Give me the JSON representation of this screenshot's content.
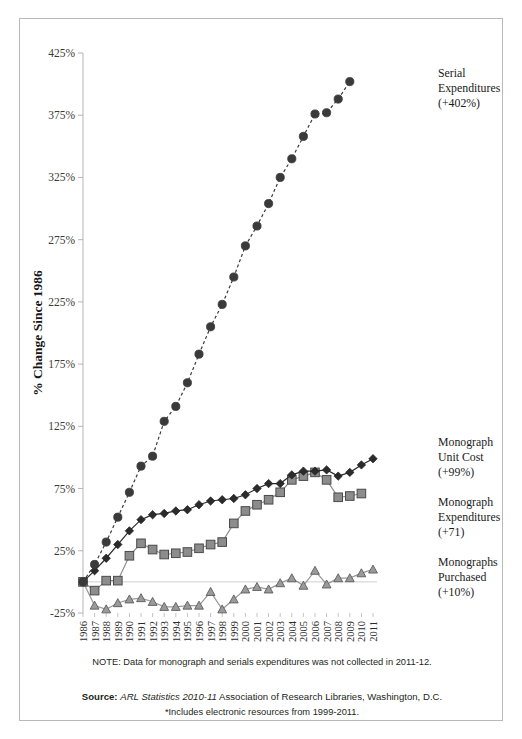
{
  "chart_data": {
    "type": "line",
    "title": "",
    "xlabel": "",
    "ylabel": "% Change Since 1986",
    "ylim": [
      -25,
      425
    ],
    "ytick_labels": [
      "425%",
      "375%",
      "325%",
      "275%",
      "225%",
      "175%",
      "125%",
      "75%",
      "25%",
      "-25%"
    ],
    "ytick_values": [
      425,
      375,
      325,
      275,
      225,
      175,
      125,
      75,
      25,
      -25
    ],
    "grid": false,
    "legend_position": "right-inline",
    "categories": [
      "1986",
      "1987",
      "1988",
      "1989",
      "1990",
      "1991",
      "1992",
      "1993",
      "1994",
      "1995",
      "1996",
      "1997",
      "1998",
      "1999",
      "2000",
      "2001",
      "2002",
      "2003",
      "2004",
      "2005",
      "2006",
      "2007",
      "2008",
      "2009",
      "2010",
      "2011"
    ],
    "series": [
      {
        "name": "Serial Expenditures",
        "marker": "circle",
        "line_style": "dashed",
        "color": "#3a3a3a",
        "change_label": "(+402%)",
        "values": [
          0,
          14,
          32,
          52,
          72,
          93,
          101,
          129,
          141,
          160,
          183,
          205,
          223,
          245,
          270,
          286,
          304,
          325,
          340,
          358,
          376,
          377,
          388,
          402,
          null,
          null
        ]
      },
      {
        "name": "Monograph Unit Cost",
        "marker": "diamond",
        "line_style": "solid",
        "color": "#2b2b2b",
        "change_label": "(+99%)",
        "values": [
          0,
          9,
          19,
          30,
          41,
          50,
          54,
          55,
          57,
          58,
          62,
          65,
          66,
          67,
          70,
          75,
          79,
          79,
          86,
          89,
          89,
          90,
          85,
          88,
          94,
          99
        ]
      },
      {
        "name": "Monograph Expenditures",
        "marker": "square",
        "line_style": "solid",
        "color": "#8c8c8c",
        "change_label": "(+71)",
        "values": [
          0,
          -7,
          1,
          1,
          21,
          31,
          26,
          22,
          23,
          24,
          27,
          30,
          32,
          47,
          57,
          62,
          66,
          72,
          82,
          85,
          88,
          82,
          68,
          69,
          71,
          null
        ]
      },
      {
        "name": "Monographs Purchased",
        "marker": "triangle",
        "line_style": "solid",
        "color": "#9a9a9a",
        "change_label": "(+10%)",
        "values": [
          0,
          -19,
          -22,
          -17,
          -14,
          -13,
          -16,
          -20,
          -20,
          -19,
          -19,
          -8,
          -22,
          -14,
          -6,
          -4,
          -6,
          -1,
          3,
          -3,
          9,
          -2,
          3,
          3,
          7,
          10
        ]
      }
    ],
    "annotations": [
      {
        "id": "serial-label",
        "lines": [
          "Serial",
          "Expenditures",
          "(+402%)"
        ]
      },
      {
        "id": "unit-cost-label",
        "lines": [
          "Monograph",
          "Unit Cost",
          "(+99%)"
        ]
      },
      {
        "id": "mono-exp-label",
        "lines": [
          "Monograph",
          "Expenditures",
          "(+71)"
        ]
      },
      {
        "id": "mono-pur-label",
        "lines": [
          "Monographs",
          "Purchased",
          "(+10%)"
        ]
      }
    ]
  },
  "footnotes": {
    "note": "NOTE: Data for monograph and serials expenditures was not collected in 2011-12.",
    "source_bold": "Source:",
    "source_italic": "ARL Statistics 2010-11",
    "source_rest": "Association of Research Libraries, Washington, D.C.",
    "asterisk": "*Includes electronic resources from 1999-2011."
  }
}
